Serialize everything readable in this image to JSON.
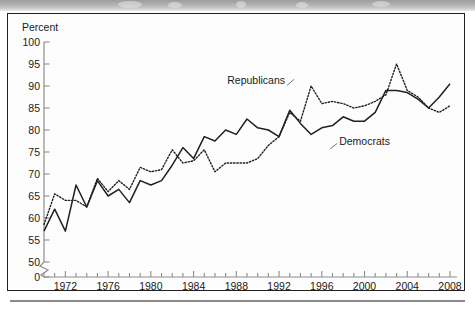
{
  "figure": {
    "axis_title_y": "Percent",
    "series_label_republicans": "Republicans",
    "series_label_democrats": "Democrats",
    "colors": {
      "line": "#231f20",
      "axis": "#8d8d8d",
      "frame": "#231f20",
      "background": "#fdfdfd"
    }
  },
  "chart_data": {
    "type": "line",
    "title": "",
    "xlabel": "",
    "ylabel": "Percent",
    "xlim": [
      1970,
      2008
    ],
    "ylim": [
      50,
      100
    ],
    "y_axis_break": true,
    "y_axis_break_value": 0,
    "grid": false,
    "legend": "inline-annotations",
    "yticks": [
      0,
      50,
      55,
      60,
      65,
      70,
      75,
      80,
      85,
      90,
      95,
      100
    ],
    "ytick_labels": [
      "0",
      "50",
      "55",
      "60",
      "65",
      "70",
      "75",
      "80",
      "85",
      "90",
      "95",
      "100"
    ],
    "xticks": [
      1972,
      1976,
      1980,
      1984,
      1988,
      1992,
      1996,
      2000,
      2004,
      2008
    ],
    "xtick_labels": [
      "1972",
      "1976",
      "1980",
      "1984",
      "1988",
      "1992",
      "1996",
      "2000",
      "2004",
      "2008"
    ],
    "x_minor_tick_step": 1,
    "x": [
      1970,
      1971,
      1972,
      1973,
      1974,
      1975,
      1976,
      1977,
      1978,
      1979,
      1980,
      1981,
      1982,
      1983,
      1984,
      1985,
      1986,
      1987,
      1988,
      1989,
      1990,
      1991,
      1992,
      1993,
      1994,
      1995,
      1996,
      1997,
      1998,
      1999,
      2000,
      2001,
      2002,
      2003,
      2004,
      2005,
      2006,
      2007,
      2008
    ],
    "series": [
      {
        "name": "Democrats",
        "style": "solid",
        "values": [
          57.0,
          62.0,
          57.0,
          67.5,
          62.5,
          68.5,
          65.0,
          66.5,
          63.5,
          68.5,
          67.5,
          68.5,
          72.0,
          76.0,
          73.5,
          78.5,
          77.5,
          80.0,
          79.0,
          82.5,
          80.5,
          80.0,
          78.5,
          84.5,
          81.5,
          79.0,
          80.5,
          81.0,
          83.0,
          82.0,
          82.0,
          84.0,
          89.0,
          89.0,
          88.5,
          87.0,
          85.0,
          87.5,
          90.5
        ]
      },
      {
        "name": "Republicans",
        "style": "dotted",
        "values": [
          58.5,
          65.5,
          64.0,
          64.0,
          62.5,
          69.0,
          66.0,
          68.5,
          66.5,
          71.5,
          70.5,
          71.0,
          75.5,
          72.5,
          73.0,
          75.5,
          70.5,
          72.5,
          72.5,
          72.5,
          73.5,
          76.5,
          78.5,
          84.0,
          82.0,
          90.0,
          86.0,
          86.5,
          86.0,
          85.0,
          85.5,
          86.5,
          88.0,
          95.0,
          89.0,
          87.5,
          85.0,
          84.0,
          85.5
        ]
      }
    ],
    "annotations": [
      {
        "text": "Republicans",
        "series": "Republicans",
        "x": 1992,
        "y": 90.5
      },
      {
        "text": "Democrats",
        "series": "Democrats",
        "x": 1998,
        "y": 76.5
      }
    ]
  }
}
